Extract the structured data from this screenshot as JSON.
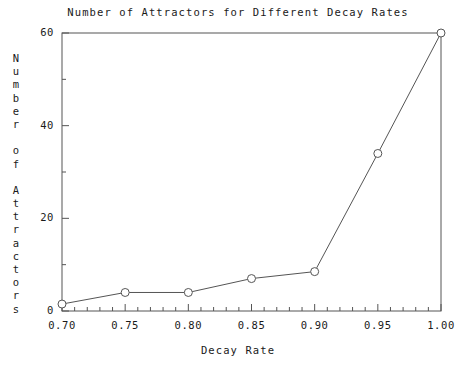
{
  "chart_data": {
    "type": "line",
    "title": "Number of Attractors for Different Decay Rates",
    "xlabel": "Decay Rate",
    "ylabel": "Number of Attractors",
    "x": [
      0.7,
      0.75,
      0.8,
      0.85,
      0.9,
      0.95,
      1.0
    ],
    "values": [
      1.5,
      4,
      4,
      7,
      8.5,
      34,
      60
    ],
    "series": [
      {
        "name": "Number of Attractors",
        "x": [
          0.7,
          0.75,
          0.8,
          0.85,
          0.9,
          0.95,
          1.0
        ],
        "values": [
          1.5,
          4,
          4,
          7,
          8.5,
          34,
          60
        ]
      }
    ],
    "xlim": [
      0.7,
      1.0
    ],
    "ylim": [
      0,
      60
    ],
    "xticks": [
      0.7,
      0.75,
      0.8,
      0.85,
      0.9,
      0.95,
      1.0
    ],
    "xtick_labels": [
      "0.70",
      "0.75",
      "0.80",
      "0.85",
      "0.90",
      "0.95",
      "1.00"
    ],
    "yticks": [
      0,
      20,
      40,
      60
    ],
    "ytick_labels": [
      "0",
      "20",
      "40",
      "60"
    ],
    "y_minor_ticks": [
      10,
      30,
      50
    ],
    "x_minor_tick_step": 0.01,
    "grid": false,
    "legend": null,
    "marker": "open-circle",
    "line_color": "#555555",
    "marker_color": "#555555",
    "axis_color": "#555555",
    "background_color": "#ffffff"
  },
  "ylabel_chars": [
    "N",
    "u",
    "m",
    "b",
    "e",
    "r",
    "",
    "o",
    "f",
    "",
    "A",
    "t",
    "t",
    "r",
    "a",
    "c",
    "t",
    "o",
    "r",
    "s"
  ]
}
